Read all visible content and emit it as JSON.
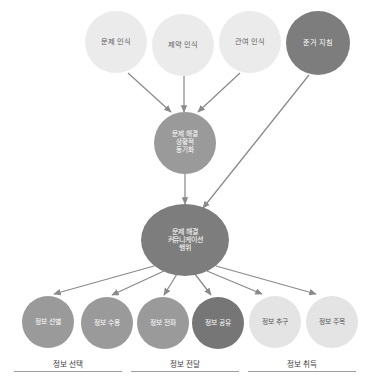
{
  "diagram": {
    "colors": {
      "light": "#ebebeb",
      "lighter": "#e4e4e4",
      "mid": "#9a9a9a",
      "dark": "#7d7d7d",
      "darker": "#767676",
      "edge": "#8a8a8a",
      "rule": "#9e9e9e",
      "background": "#ffffff"
    },
    "antecedents": [
      {
        "id": "problem-recognition",
        "label": "문제 인식",
        "shade": "light"
      },
      {
        "id": "constraint-recognition",
        "label": "제약 인식",
        "shade": "light"
      },
      {
        "id": "involvement-recognition",
        "label": "관여 인식",
        "shade": "light"
      },
      {
        "id": "referent-criterion",
        "label": "준거 지침",
        "shade": "dark"
      }
    ],
    "mediator": {
      "id": "situational-motivation",
      "label": "문제 해결\n상황적\n동기화",
      "shade": "mid"
    },
    "hub": {
      "id": "communicative-action",
      "label": "문제 해결\n커뮤니케이션\n행위",
      "shade": "dark"
    },
    "outcomes": [
      {
        "id": "information-forefending",
        "label": "정보 선별",
        "shade": "mid"
      },
      {
        "id": "information-permitting",
        "label": "정보 수용",
        "shade": "mid"
      },
      {
        "id": "information-forwarding",
        "label": "정보 전파",
        "shade": "mid"
      },
      {
        "id": "information-sharing",
        "label": "정보 공유",
        "shade": "darker"
      },
      {
        "id": "information-seeking",
        "label": "정보 추구",
        "shade": "lighter"
      },
      {
        "id": "information-attending",
        "label": "정보 주목",
        "shade": "lighter"
      }
    ],
    "groups": [
      {
        "id": "information-selection",
        "label": "정보 선택"
      },
      {
        "id": "information-transmission",
        "label": "정보 전달"
      },
      {
        "id": "information-acquisition",
        "label": "정보 취득"
      }
    ]
  }
}
